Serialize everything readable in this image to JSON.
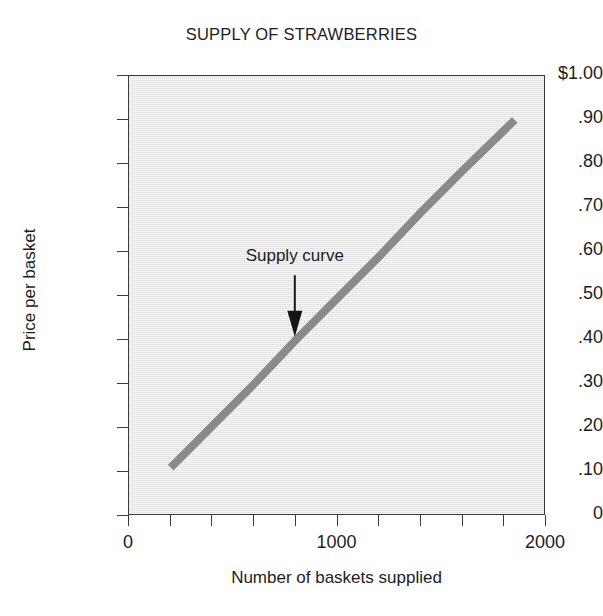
{
  "chart_data": {
    "type": "line",
    "title": "SUPPLY OF STRAWBERRIES",
    "xlabel": "Number of baskets supplied",
    "ylabel": "Price per basket",
    "xlim": [
      0,
      2000
    ],
    "ylim": [
      0,
      1.0
    ],
    "grid": false,
    "legend": "none",
    "background_color": "#e7e7e7",
    "frame_color": "#3a3a3a",
    "series": [
      {
        "name": "Supply curve",
        "color": "#8a8a8a",
        "line_width_px": 8,
        "x": [
          200,
          1850
        ],
        "y": [
          0.11,
          0.9
        ],
        "points": [
          {
            "x": 200,
            "y": 0.11
          },
          {
            "x": 400,
            "y": 0.205
          },
          {
            "x": 600,
            "y": 0.3
          },
          {
            "x": 800,
            "y": 0.4
          },
          {
            "x": 1000,
            "y": 0.495
          },
          {
            "x": 1200,
            "y": 0.59
          },
          {
            "x": 1400,
            "y": 0.69
          },
          {
            "x": 1600,
            "y": 0.785
          },
          {
            "x": 1850,
            "y": 0.9
          }
        ]
      }
    ],
    "x_ticks": [
      {
        "value": 0,
        "label": "0"
      },
      {
        "value": 200,
        "label": ""
      },
      {
        "value": 400,
        "label": ""
      },
      {
        "value": 600,
        "label": ""
      },
      {
        "value": 800,
        "label": ""
      },
      {
        "value": 1000,
        "label": "1000"
      },
      {
        "value": 1200,
        "label": ""
      },
      {
        "value": 1400,
        "label": ""
      },
      {
        "value": 1600,
        "label": ""
      },
      {
        "value": 1800,
        "label": ""
      },
      {
        "value": 2000,
        "label": "2000"
      }
    ],
    "y_ticks": [
      {
        "value": 1.0,
        "label": "$1.00"
      },
      {
        "value": 0.9,
        "label": ".90"
      },
      {
        "value": 0.8,
        "label": ".80"
      },
      {
        "value": 0.7,
        "label": ".70"
      },
      {
        "value": 0.6,
        "label": ".60"
      },
      {
        "value": 0.5,
        "label": ".50"
      },
      {
        "value": 0.4,
        "label": ".40"
      },
      {
        "value": 0.3,
        "label": ".30"
      },
      {
        "value": 0.2,
        "label": ".20"
      },
      {
        "value": 0.1,
        "label": ".10"
      },
      {
        "value": 0.0,
        "label": "0"
      }
    ],
    "annotations": [
      {
        "text": "Supply curve",
        "label_x": 800,
        "label_y": 0.585,
        "arrow_from": {
          "x": 800,
          "y": 0.545
        },
        "arrow_to": {
          "x": 800,
          "y": 0.405
        }
      }
    ]
  }
}
